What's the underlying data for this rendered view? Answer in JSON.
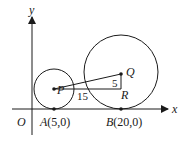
{
  "diagram": {
    "axes": {
      "x_label": "x",
      "y_label": "y",
      "origin_label": "O"
    },
    "points": {
      "A": {
        "name": "A",
        "coords": "(5,0)",
        "x": 5,
        "y": 0
      },
      "B": {
        "name": "B",
        "coords": "(20,0)",
        "x": 20,
        "y": 0
      },
      "P": {
        "name": "P"
      },
      "Q": {
        "name": "Q"
      },
      "R": {
        "name": "R"
      }
    },
    "segment_labels": {
      "PR": "15",
      "QR": "5"
    },
    "colors": {
      "stroke": "#1a1a1a",
      "background": "#ffffff"
    }
  }
}
